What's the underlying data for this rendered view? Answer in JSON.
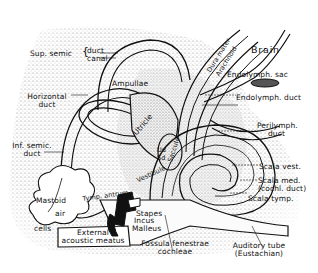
{
  "diagram": {
    "type": "anatomical illustration",
    "labels": {
      "sup_semic": "Sup. semic",
      "sup_duct": "duct",
      "sup_canal": "canal",
      "ampullae": "Ampullae",
      "horizontal_duct_1": "Horizontal",
      "horizontal_duct_2": "duct",
      "inf_semic_1": "Inf. semic.",
      "inf_semic_2": "duct",
      "utricle": "Utricle",
      "ud": "Ud",
      "sd": "Sd",
      "saccule": "Saccule",
      "vestibule": "Vestibule",
      "dura_mater": "Dura mater",
      "arachnoid": "Arachnoid",
      "brain": "Brain",
      "endolymph_sac": "Endolymph. sac",
      "endolymph_duct": "Endolymph. duct",
      "perilymph_duct_1": "Perilymph.",
      "perilymph_duct_2": "duct",
      "scala_vest": "Scala vest.",
      "scala_med_1": "Scala med.",
      "scala_med_2": "(cochl. duct)",
      "scala_tymp": "Scala tymp.",
      "tymp_antrum": "Tymp. antrum",
      "mastoid": "Mastoid",
      "air": "air",
      "cells": "cells",
      "stapes": "Stapes",
      "incus": "Incus",
      "malleus": "Malleus",
      "external_1": "External",
      "external_2": "acoustic meatus",
      "fossula_1": "Fossula fenestrae",
      "fossula_2": "cochleae",
      "auditory_1": "Auditory tube",
      "auditory_2": "(Eustachian)"
    },
    "colors": {
      "ink": "#111111",
      "stipple": "#9a9a9a",
      "background": "#ffffff"
    }
  }
}
